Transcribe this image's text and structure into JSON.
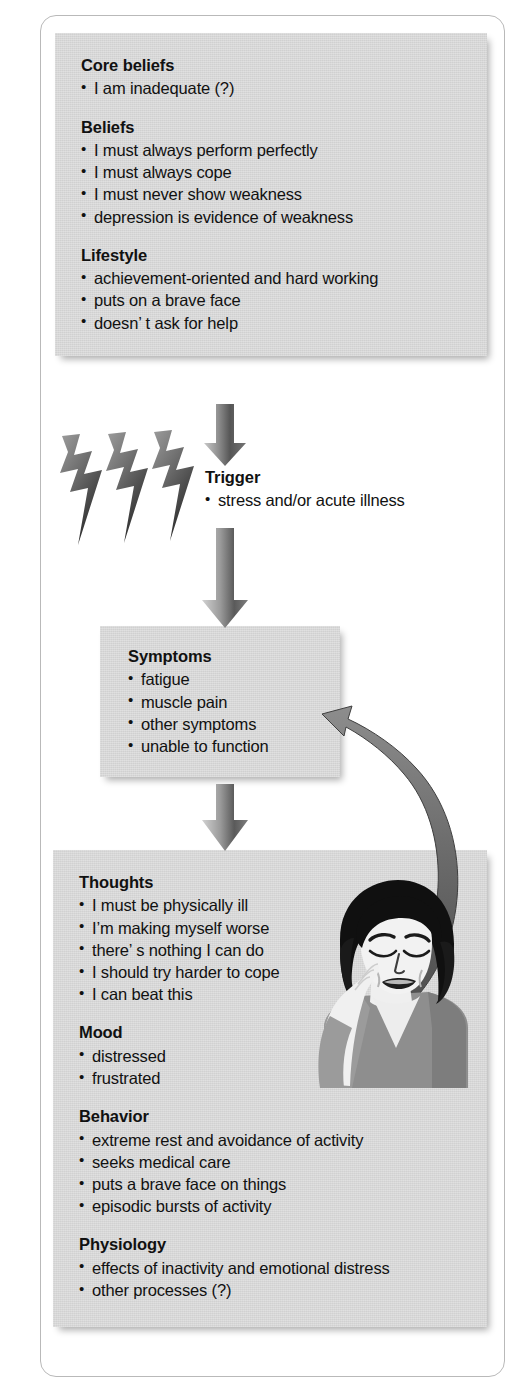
{
  "diagram": {
    "sections": [
      {
        "id": "core-beliefs",
        "heading": "Core beliefs",
        "items": [
          "I am inadequate (?)"
        ]
      },
      {
        "id": "beliefs",
        "heading": "Beliefs",
        "items": [
          "I must always perform perfectly",
          "I must always cope",
          "I must never show weakness",
          "depression is evidence of weakness"
        ]
      },
      {
        "id": "lifestyle",
        "heading": "Lifestyle",
        "items": [
          "achievement-oriented and hard working",
          "puts on a brave face",
          "doesn’ t ask for help"
        ]
      },
      {
        "id": "trigger",
        "heading": "Trigger",
        "items": [
          "stress and/or acute illness"
        ]
      },
      {
        "id": "symptoms",
        "heading": "Symptoms",
        "items": [
          "fatigue",
          "muscle pain",
          "other symptoms",
          "unable to function"
        ]
      },
      {
        "id": "thoughts",
        "heading": "Thoughts",
        "items": [
          "I must be physically ill",
          "I’m making myself worse",
          "there’ s nothing I can do",
          "I should try harder to cope",
          "I can beat this"
        ]
      },
      {
        "id": "mood",
        "heading": "Mood",
        "items": [
          "distressed",
          "frustrated"
        ]
      },
      {
        "id": "behavior",
        "heading": "Behavior",
        "items": [
          "extreme rest and avoidance of activity",
          "seeks medical care",
          "puts a brave face on things",
          "episodic bursts of activity"
        ]
      },
      {
        "id": "physiology",
        "heading": "Physiology",
        "items": [
          "effects of inactivity and emotional distress",
          "other processes (?)"
        ]
      }
    ],
    "graphics": [
      {
        "name": "down-arrow-beliefs-to-trigger",
        "kind": "arrow-down"
      },
      {
        "name": "lightning-bolts",
        "kind": "lightning",
        "count": 3
      },
      {
        "name": "down-arrow-trigger-to-symptoms",
        "kind": "arrow-down"
      },
      {
        "name": "down-arrow-symptoms-to-thoughts",
        "kind": "arrow-down"
      },
      {
        "name": "curved-arrow-thoughts-to-symptoms",
        "kind": "arrow-curved-up"
      },
      {
        "name": "woman-illustration",
        "kind": "illustration"
      }
    ],
    "colors": {
      "panel_fill": "#d6d6d6",
      "page_background": "#ffffff",
      "frame_border": "#b9b9b9",
      "text": "#111111",
      "arrow_dark": "#5b5b5b",
      "arrow_light": "#cfcfcf",
      "hair": "#111111",
      "skin": "#f2f2f2",
      "garment": "#8c8c8c"
    }
  }
}
